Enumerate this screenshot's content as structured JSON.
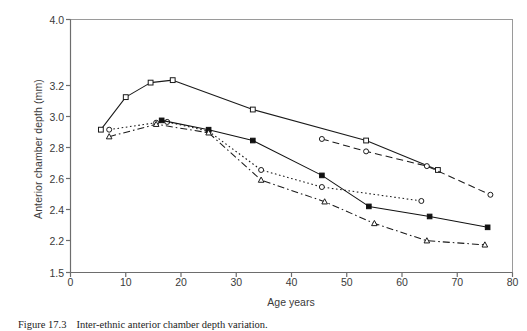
{
  "figure": {
    "caption_label": "Figure 17.3",
    "caption_text": "Inter-ethnic anterior chamber depth variation."
  },
  "axes": {
    "y_title": "Anterior chamber depth (mm)",
    "x_title": "Age years",
    "y_ticks": [
      "4.0",
      "3.2",
      "3.0",
      "2.8",
      "2.6",
      "2.4",
      "2.2",
      "1.5"
    ],
    "x_ticks": [
      "0",
      "10",
      "20",
      "30",
      "40",
      "50",
      "60",
      "70",
      "80"
    ]
  },
  "chart_data": {
    "type": "line",
    "title": "",
    "xlabel": "Age years",
    "ylabel": "Anterior chamber depth (mm)",
    "xlim": [
      0,
      80
    ],
    "ylim": [
      1.5,
      4.0
    ],
    "grid": false,
    "legend": "none",
    "x_tick_values": [
      0,
      10,
      20,
      30,
      40,
      50,
      60,
      70,
      80
    ],
    "y_tick_values": [
      1.5,
      2.2,
      2.4,
      2.6,
      2.8,
      3.0,
      3.2,
      4.0
    ],
    "y_axis_note": "non-uniform axis: 2.2 through 3.2 evenly spaced; 1.5 and 4.0 are compressed end ticks",
    "series": [
      {
        "name": "series-1",
        "line_style": "solid",
        "marker": "open-square",
        "color": "#1a1a1a",
        "points": [
          {
            "x": 5.5,
            "y": 2.915
          },
          {
            "x": 10.0,
            "y": 3.125
          },
          {
            "x": 14.5,
            "y": 3.235
          },
          {
            "x": 18.5,
            "y": 3.265
          },
          {
            "x": 33.0,
            "y": 3.045
          },
          {
            "x": 53.5,
            "y": 2.845
          },
          {
            "x": 66.5,
            "y": 2.655
          }
        ]
      },
      {
        "name": "series-2",
        "line_style": "dashed",
        "marker": "open-circle",
        "color": "#1a1a1a",
        "points": [
          {
            "x": 45.5,
            "y": 2.855
          },
          {
            "x": 53.5,
            "y": 2.775
          },
          {
            "x": 64.5,
            "y": 2.68
          },
          {
            "x": 76.0,
            "y": 2.495
          }
        ]
      },
      {
        "name": "series-3",
        "line_style": "dotted",
        "marker": "open-circle",
        "color": "#1a1a1a",
        "points": [
          {
            "x": 7.0,
            "y": 2.915
          },
          {
            "x": 15.5,
            "y": 2.96
          },
          {
            "x": 17.5,
            "y": 2.965
          },
          {
            "x": 25.0,
            "y": 2.905
          },
          {
            "x": 34.5,
            "y": 2.655
          },
          {
            "x": 45.5,
            "y": 2.545
          },
          {
            "x": 63.5,
            "y": 2.455
          }
        ]
      },
      {
        "name": "series-4",
        "line_style": "solid",
        "marker": "filled-square",
        "color": "#111111",
        "points": [
          {
            "x": 16.5,
            "y": 2.975
          },
          {
            "x": 25.0,
            "y": 2.915
          },
          {
            "x": 33.0,
            "y": 2.845
          },
          {
            "x": 45.5,
            "y": 2.62
          },
          {
            "x": 54.0,
            "y": 2.42
          },
          {
            "x": 65.0,
            "y": 2.355
          },
          {
            "x": 75.5,
            "y": 2.285
          }
        ]
      },
      {
        "name": "series-5",
        "line_style": "dash-dot",
        "marker": "open-triangle",
        "color": "#1a1a1a",
        "points": [
          {
            "x": 7.0,
            "y": 2.87
          },
          {
            "x": 15.5,
            "y": 2.95
          },
          {
            "x": 25.0,
            "y": 2.895
          },
          {
            "x": 34.5,
            "y": 2.59
          },
          {
            "x": 46.0,
            "y": 2.45
          },
          {
            "x": 55.0,
            "y": 2.31
          },
          {
            "x": 64.5,
            "y": 2.195
          },
          {
            "x": 75.0,
            "y": 2.105
          }
        ]
      }
    ]
  }
}
